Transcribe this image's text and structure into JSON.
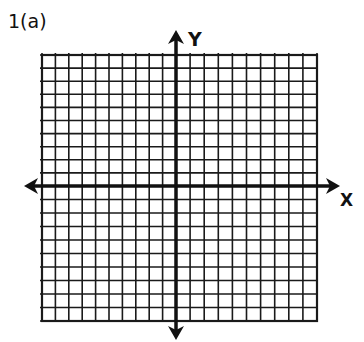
{
  "problem": {
    "label": "1(a)"
  },
  "axes": {
    "x_label": "X",
    "y_label": "Y",
    "color": "#111111"
  },
  "grid": {
    "squares_left_of_y": 10,
    "squares_right_of_y": 10,
    "squares_above_x": 10,
    "squares_below_x": 10,
    "line_color": "#1a1a1a"
  }
}
